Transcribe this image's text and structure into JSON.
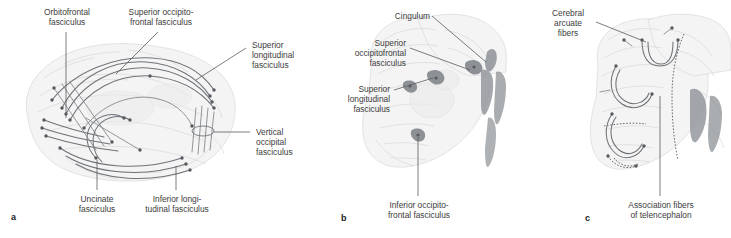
{
  "figure": {
    "panels": [
      {
        "id": "a",
        "letter": "a",
        "view": "lateral view of left hemisphere",
        "labels": [
          {
            "key": "orbitofrontal",
            "text": "Orbitofrontal\nfasciculus"
          },
          {
            "key": "sup_occipitofrontal",
            "text": "Superior occipito-\nfrontal fasciculus"
          },
          {
            "key": "sup_longitudinal",
            "text": "Superior\nlongitudinal\nfasciculus"
          },
          {
            "key": "vertical_occipital",
            "text": "Vertical\noccipital\nfasciculus"
          },
          {
            "key": "uncinate",
            "text": "Uncinate\nfasciculus"
          },
          {
            "key": "inf_longitudinal",
            "text": "Inferior longi-\ntudinal fasciculus"
          }
        ]
      },
      {
        "id": "b",
        "letter": "b",
        "view": "coronal section",
        "labels": [
          {
            "key": "cingulum",
            "text": "Cingulum"
          },
          {
            "key": "sup_occipitofrontal_b",
            "text": "Superior\noccipitofrontal\nfasciculus"
          },
          {
            "key": "sup_longitudinal_b",
            "text": "Superior\nlongitudinal\nfasciculus"
          },
          {
            "key": "inf_occipitofrontal",
            "text": "Inferior occipito-\nfrontal fasciculus"
          }
        ]
      },
      {
        "id": "c",
        "letter": "c",
        "view": "coronal section, arcuate fibers",
        "labels": [
          {
            "key": "cerebral_arcuate",
            "text": "Cerebral\narcuate\nfibers"
          },
          {
            "key": "association_fibers",
            "text": "Association fibers\nof telencephalon"
          }
        ]
      }
    ]
  },
  "panel_a": {
    "letter": "a",
    "orbitofrontal": "Orbitofrontal\nfasciculus",
    "sup_occipitofrontal": "Superior occipito-\nfrontal fasciculus",
    "sup_longitudinal": "Superior\nlongitudinal\nfasciculus",
    "vertical_occipital": "Vertical\noccipital\nfasciculus",
    "uncinate": "Uncinate\nfasciculus",
    "inf_longitudinal": "Inferior longi-\ntudinal fasciculus"
  },
  "panel_b": {
    "letter": "b",
    "cingulum": "Cingulum",
    "sup_occipitofrontal": "Superior\noccipitofrontal\nfasciculus",
    "sup_longitudinal": "Superior\nlongitudinal\nfasciculus",
    "inf_occipitofrontal": "Inferior occipito-\nfrontal fasciculus"
  },
  "panel_c": {
    "letter": "c",
    "cerebral_arcuate": "Cerebral\narcuate\nfibers",
    "association_fibers": "Association fibers\nof telencephalon"
  },
  "colors": {
    "background": "#ffffff",
    "text": "#3d3d3d",
    "leader_line": "#5a5a5a",
    "brain_fill": "#f4f4f4",
    "brain_outline": "#d8d8d8",
    "tract": "#6f7378",
    "dot": "#55595e",
    "dark_blob": "#8d9196"
  }
}
